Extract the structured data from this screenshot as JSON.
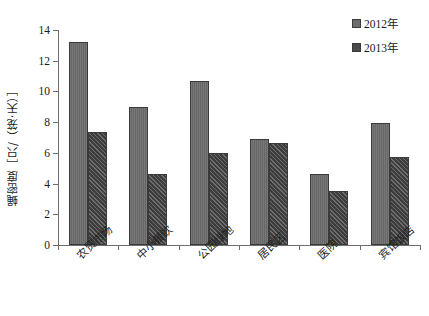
{
  "chart_data": {
    "type": "bar",
    "title": "",
    "xlabel": "",
    "ylabel": "蝇密度［只/（笼·天）］",
    "ylim": [
      0,
      14
    ],
    "ytick_labels": [
      "0",
      "2",
      "4",
      "6",
      "8",
      "10",
      "12",
      "14"
    ],
    "ytick_values": [
      0,
      2,
      4,
      6,
      8,
      10,
      12,
      14
    ],
    "grid": false,
    "legend_position": "top-right",
    "categories": [
      "农贸市场",
      "中小餐饮",
      "公园绿地",
      "居民区",
      "医院",
      "宾馆饭店"
    ],
    "series": [
      {
        "name": "2012年",
        "color": "#6d6d6d",
        "values": [
          13.2,
          9.0,
          10.65,
          6.9,
          4.65,
          7.95
        ]
      },
      {
        "name": "2013年",
        "color": "#4a4a4a",
        "values": [
          7.35,
          4.6,
          6.0,
          6.65,
          3.5,
          5.75
        ]
      }
    ]
  },
  "legend": {
    "items": [
      {
        "label": "2012年"
      },
      {
        "label": "2013年"
      }
    ]
  },
  "caption": {
    "text": ""
  }
}
